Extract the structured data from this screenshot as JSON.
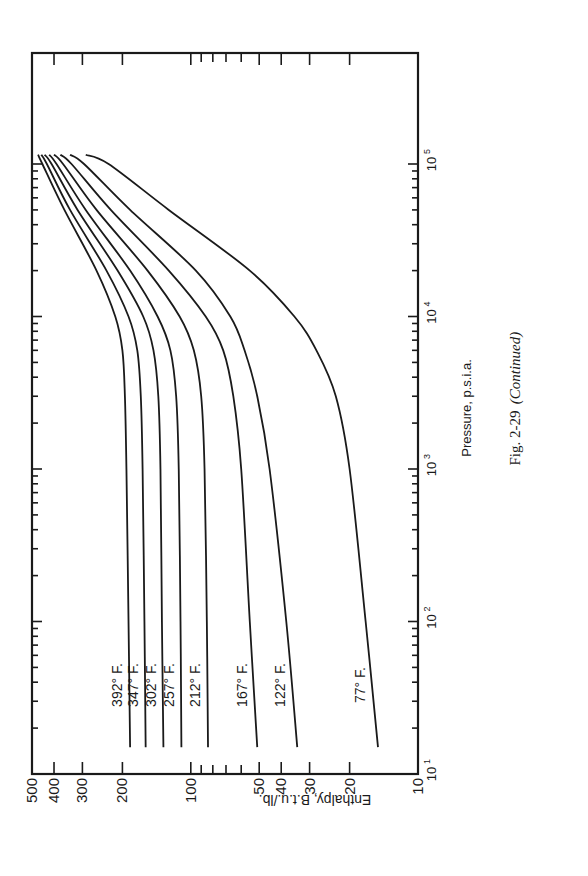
{
  "figure": {
    "caption_number": "Fig. 2-29",
    "caption_note": "(Continued)",
    "orientation": "rotated 90° counter-clockwise"
  },
  "chart_data": {
    "type": "line",
    "title": "",
    "xlabel": "Pressure, p.s.i.a.",
    "ylabel": "Enthalpy, B.t.u./lb.",
    "x_scale": "log",
    "y_scale": "log",
    "xlim": [
      10,
      150000
    ],
    "ylim": [
      10,
      500
    ],
    "x_tick_labels": [
      "10^1",
      "10^2",
      "10^3",
      "10^4",
      "10^5"
    ],
    "y_tick_labels": [
      "10",
      "20",
      "30",
      "40",
      "50",
      "100",
      "200",
      "300",
      "400",
      "500"
    ],
    "grid": false,
    "legend": "inline labels near curves",
    "series": [
      {
        "name": "392° F.",
        "x": [
          15,
          100,
          1000,
          3000,
          6000,
          10000,
          20000,
          50000,
          100000,
          115000
        ],
        "y": [
          185,
          188,
          192,
          195,
          200,
          215,
          260,
          360,
          450,
          470
        ]
      },
      {
        "name": "347° F.",
        "x": [
          15,
          100,
          1000,
          3000,
          6000,
          10000,
          20000,
          50000,
          100000,
          115000
        ],
        "y": [
          158,
          160,
          163,
          166,
          172,
          188,
          235,
          340,
          430,
          455
        ]
      },
      {
        "name": "302° F.",
        "x": [
          15,
          100,
          1000,
          3000,
          6000,
          10000,
          20000,
          50000,
          100000,
          115000
        ],
        "y": [
          132,
          134,
          136,
          139,
          146,
          162,
          210,
          315,
          410,
          440
        ]
      },
      {
        "name": "257° F.",
        "x": [
          15,
          100,
          1000,
          3000,
          6000,
          10000,
          20000,
          50000,
          100000,
          115000
        ],
        "y": [
          110,
          111,
          113,
          116,
          123,
          140,
          185,
          290,
          390,
          420
        ]
      },
      {
        "name": "212° F.",
        "x": [
          15,
          100,
          1000,
          3000,
          6000,
          10000,
          20000,
          50000,
          100000,
          115000
        ],
        "y": [
          84,
          85,
          87,
          90,
          97,
          112,
          155,
          260,
          365,
          400
        ]
      },
      {
        "name": "167° F.",
        "x": [
          15,
          100,
          1000,
          3000,
          6000,
          10000,
          20000,
          50000,
          100000,
          115000
        ],
        "y": [
          51,
          55,
          60,
          65,
          72,
          86,
          125,
          225,
          335,
          375
        ]
      },
      {
        "name": "122° F.",
        "x": [
          15,
          100,
          1000,
          3000,
          6000,
          10000,
          20000,
          50000,
          100000,
          115000
        ],
        "y": [
          34,
          38,
          45,
          51,
          58,
          67,
          95,
          185,
          295,
          340
        ]
      },
      {
        "name": "77° F.",
        "x": [
          15,
          100,
          1000,
          3000,
          6000,
          10000,
          20000,
          50000,
          100000,
          115000
        ],
        "y": [
          15,
          17,
          20,
          23,
          28,
          35,
          55,
          125,
          230,
          290
        ]
      }
    ]
  },
  "labels": {
    "y_ticks": [
      {
        "text": "500",
        "value": 500
      },
      {
        "text": "400",
        "value": 400
      },
      {
        "text": "300",
        "value": 300
      },
      {
        "text": "200",
        "value": 200
      },
      {
        "text": "100",
        "value": 100
      },
      {
        "text": "50",
        "value": 50
      },
      {
        "text": "40",
        "value": 40
      },
      {
        "text": "30",
        "value": 30
      },
      {
        "text": "20",
        "value": 20
      },
      {
        "text": "10",
        "value": 10
      }
    ],
    "x_ticks": [
      {
        "base": "10",
        "exp": "1",
        "value": 10
      },
      {
        "base": "10",
        "exp": "2",
        "value": 100
      },
      {
        "base": "10",
        "exp": "3",
        "value": 1000
      },
      {
        "base": "10",
        "exp": "4",
        "value": 10000
      },
      {
        "base": "10",
        "exp": "5",
        "value": 100000
      }
    ],
    "curve_label_pressure": 35
  }
}
